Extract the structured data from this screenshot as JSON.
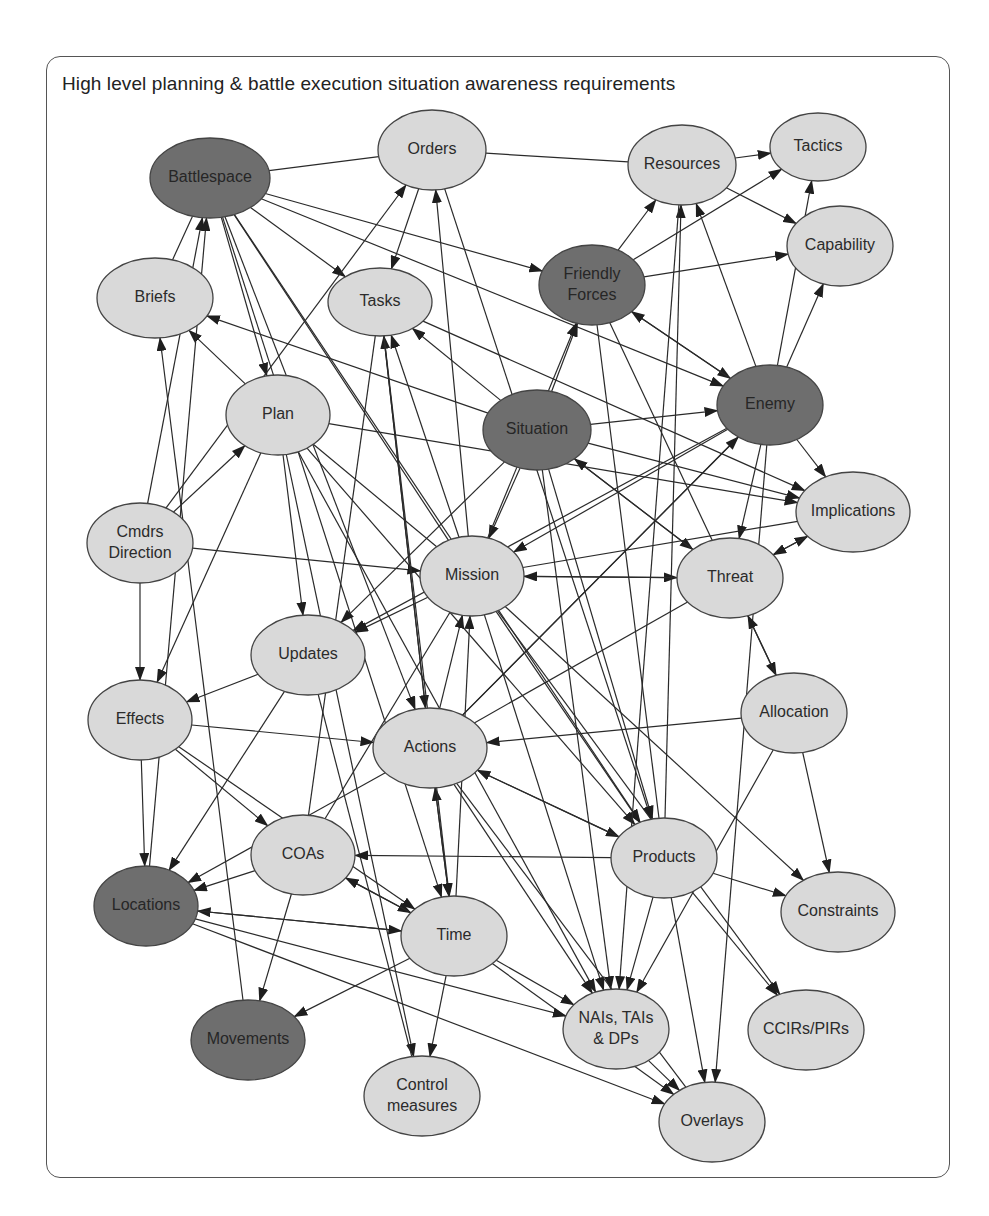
{
  "title": "High level planning & battle execution situation awareness requirements",
  "colors": {
    "light_node": "#d9d9d9",
    "dark_node": "#6e6e6e",
    "edge": "#2a2a2a",
    "border": "#555555"
  },
  "nodes": [
    {
      "id": "battlespace",
      "label": [
        "Battlespace"
      ],
      "x": 210,
      "y": 178,
      "rx": 60,
      "ry": 40,
      "dark": true
    },
    {
      "id": "orders",
      "label": [
        "Orders"
      ],
      "x": 432,
      "y": 150,
      "rx": 54,
      "ry": 40,
      "dark": false
    },
    {
      "id": "resources",
      "label": [
        "Resources"
      ],
      "x": 682,
      "y": 165,
      "rx": 54,
      "ry": 40,
      "dark": false
    },
    {
      "id": "tactics",
      "label": [
        "Tactics"
      ],
      "x": 818,
      "y": 147,
      "rx": 48,
      "ry": 34,
      "dark": false
    },
    {
      "id": "capability",
      "label": [
        "Capability"
      ],
      "x": 840,
      "y": 246,
      "rx": 53,
      "ry": 40,
      "dark": false
    },
    {
      "id": "briefs",
      "label": [
        "Briefs"
      ],
      "x": 155,
      "y": 298,
      "rx": 58,
      "ry": 40,
      "dark": false
    },
    {
      "id": "tasks",
      "label": [
        "Tasks"
      ],
      "x": 380,
      "y": 302,
      "rx": 52,
      "ry": 34,
      "dark": false
    },
    {
      "id": "friendly-forces",
      "label": [
        "Friendly",
        "Forces"
      ],
      "x": 592,
      "y": 285,
      "rx": 53,
      "ry": 40,
      "dark": true
    },
    {
      "id": "plan",
      "label": [
        "Plan"
      ],
      "x": 278,
      "y": 415,
      "rx": 52,
      "ry": 40,
      "dark": false
    },
    {
      "id": "situation",
      "label": [
        "Situation"
      ],
      "x": 537,
      "y": 430,
      "rx": 54,
      "ry": 40,
      "dark": true
    },
    {
      "id": "enemy",
      "label": [
        "Enemy"
      ],
      "x": 770,
      "y": 405,
      "rx": 53,
      "ry": 40,
      "dark": true
    },
    {
      "id": "cmdrs-direction",
      "label": [
        "Cmdrs",
        "Direction"
      ],
      "x": 140,
      "y": 543,
      "rx": 53,
      "ry": 40,
      "dark": false
    },
    {
      "id": "implications",
      "label": [
        "Implications"
      ],
      "x": 853,
      "y": 512,
      "rx": 57,
      "ry": 40,
      "dark": false
    },
    {
      "id": "mission",
      "label": [
        "Mission"
      ],
      "x": 472,
      "y": 576,
      "rx": 52,
      "ry": 40,
      "dark": false
    },
    {
      "id": "threat",
      "label": [
        "Threat"
      ],
      "x": 730,
      "y": 578,
      "rx": 53,
      "ry": 40,
      "dark": false
    },
    {
      "id": "updates",
      "label": [
        "Updates"
      ],
      "x": 308,
      "y": 655,
      "rx": 57,
      "ry": 40,
      "dark": false
    },
    {
      "id": "effects",
      "label": [
        "Effects"
      ],
      "x": 140,
      "y": 720,
      "rx": 52,
      "ry": 40,
      "dark": false
    },
    {
      "id": "allocation",
      "label": [
        "Allocation"
      ],
      "x": 794,
      "y": 713,
      "rx": 53,
      "ry": 40,
      "dark": false
    },
    {
      "id": "actions",
      "label": [
        "Actions"
      ],
      "x": 430,
      "y": 748,
      "rx": 57,
      "ry": 40,
      "dark": false
    },
    {
      "id": "coas",
      "label": [
        "COAs"
      ],
      "x": 303,
      "y": 855,
      "rx": 52,
      "ry": 40,
      "dark": false
    },
    {
      "id": "products",
      "label": [
        "Products"
      ],
      "x": 664,
      "y": 858,
      "rx": 53,
      "ry": 40,
      "dark": false
    },
    {
      "id": "locations",
      "label": [
        "Locations"
      ],
      "x": 146,
      "y": 906,
      "rx": 52,
      "ry": 40,
      "dark": true
    },
    {
      "id": "constraints",
      "label": [
        "Constraints"
      ],
      "x": 838,
      "y": 912,
      "rx": 57,
      "ry": 40,
      "dark": false
    },
    {
      "id": "time",
      "label": [
        "Time"
      ],
      "x": 454,
      "y": 936,
      "rx": 53,
      "ry": 40,
      "dark": false
    },
    {
      "id": "nais",
      "label": [
        "NAIs, TAIs",
        "& DPs"
      ],
      "x": 616,
      "y": 1029,
      "rx": 53,
      "ry": 40,
      "dark": false
    },
    {
      "id": "ccirs",
      "label": [
        "CCIRs/PIRs"
      ],
      "x": 806,
      "y": 1030,
      "rx": 58,
      "ry": 40,
      "dark": false
    },
    {
      "id": "movements",
      "label": [
        "Movements"
      ],
      "x": 248,
      "y": 1040,
      "rx": 57,
      "ry": 40,
      "dark": true
    },
    {
      "id": "control-measures",
      "label": [
        "Control",
        "measures"
      ],
      "x": 422,
      "y": 1096,
      "rx": 58,
      "ry": 40,
      "dark": false
    },
    {
      "id": "overlays",
      "label": [
        "Overlays"
      ],
      "x": 712,
      "y": 1122,
      "rx": 53,
      "ry": 40,
      "dark": false
    }
  ],
  "edges": [
    {
      "from": "battlespace",
      "to": "orders",
      "arrow": false
    },
    {
      "from": "battlespace",
      "to": "tasks",
      "arrow": true
    },
    {
      "from": "battlespace",
      "to": "friendly-forces",
      "arrow": true
    },
    {
      "from": "battlespace",
      "to": "enemy",
      "arrow": true
    },
    {
      "from": "battlespace",
      "to": "plan",
      "arrow": true
    },
    {
      "from": "battlespace",
      "to": "actions",
      "arrow": true
    },
    {
      "from": "battlespace",
      "to": "mission",
      "arrow": false
    },
    {
      "from": "battlespace",
      "to": "products",
      "arrow": true
    },
    {
      "from": "battlespace",
      "to": "time",
      "arrow": true
    },
    {
      "from": "orders",
      "to": "resources",
      "arrow": false
    },
    {
      "from": "orders",
      "to": "tasks",
      "arrow": true
    },
    {
      "from": "orders",
      "to": "products",
      "arrow": true
    },
    {
      "from": "resources",
      "to": "tactics",
      "arrow": true
    },
    {
      "from": "resources",
      "to": "capability",
      "arrow": true
    },
    {
      "from": "friendly-forces",
      "to": "resources",
      "arrow": true
    },
    {
      "from": "friendly-forces",
      "to": "tactics",
      "arrow": true
    },
    {
      "from": "friendly-forces",
      "to": "capability",
      "arrow": true
    },
    {
      "from": "friendly-forces",
      "to": "enemy",
      "arrow": true
    },
    {
      "from": "friendly-forces",
      "to": "threat",
      "arrow": false
    },
    {
      "from": "friendly-forces",
      "to": "products",
      "arrow": false
    },
    {
      "from": "enemy",
      "to": "capability",
      "arrow": true
    },
    {
      "from": "enemy",
      "to": "tactics",
      "arrow": true
    },
    {
      "from": "enemy",
      "to": "resources",
      "arrow": true
    },
    {
      "from": "enemy",
      "to": "friendly-forces",
      "arrow": true
    },
    {
      "from": "enemy",
      "to": "implications",
      "arrow": true
    },
    {
      "from": "enemy",
      "to": "threat",
      "arrow": true
    },
    {
      "from": "enemy",
      "to": "mission",
      "arrow": true
    },
    {
      "from": "enemy",
      "to": "updates",
      "arrow": true
    },
    {
      "from": "enemy",
      "to": "overlays",
      "arrow": true
    },
    {
      "from": "enemy",
      "to": "actions",
      "arrow": false
    },
    {
      "from": "situation",
      "to": "friendly-forces",
      "arrow": true
    },
    {
      "from": "situation",
      "to": "enemy",
      "arrow": true
    },
    {
      "from": "situation",
      "to": "tasks",
      "arrow": true
    },
    {
      "from": "situation",
      "to": "briefs",
      "arrow": true
    },
    {
      "from": "situation",
      "to": "mission",
      "arrow": true
    },
    {
      "from": "situation",
      "to": "implications",
      "arrow": true
    },
    {
      "from": "situation",
      "to": "threat",
      "arrow": true
    },
    {
      "from": "situation",
      "to": "products",
      "arrow": true
    },
    {
      "from": "situation",
      "to": "nais",
      "arrow": true
    },
    {
      "from": "situation",
      "to": "updates",
      "arrow": true
    },
    {
      "from": "plan",
      "to": "briefs",
      "arrow": true
    },
    {
      "from": "plan",
      "to": "implications",
      "arrow": true
    },
    {
      "from": "plan",
      "to": "updates",
      "arrow": true
    },
    {
      "from": "plan",
      "to": "effects",
      "arrow": true
    },
    {
      "from": "plan",
      "to": "products",
      "arrow": true
    },
    {
      "from": "plan",
      "to": "control-measures",
      "arrow": true
    },
    {
      "from": "plan",
      "to": "mission",
      "arrow": false
    },
    {
      "from": "plan",
      "to": "nais",
      "arrow": true
    },
    {
      "from": "cmdrs-direction",
      "to": "plan",
      "arrow": true
    },
    {
      "from": "cmdrs-direction",
      "to": "orders",
      "arrow": true
    },
    {
      "from": "cmdrs-direction",
      "to": "mission",
      "arrow": true
    },
    {
      "from": "cmdrs-direction",
      "to": "effects",
      "arrow": true
    },
    {
      "from": "cmdrs-direction",
      "to": "battlespace",
      "arrow": true
    },
    {
      "from": "mission",
      "to": "tasks",
      "arrow": true
    },
    {
      "from": "mission",
      "to": "orders",
      "arrow": true
    },
    {
      "from": "mission",
      "to": "friendly-forces",
      "arrow": true
    },
    {
      "from": "mission",
      "to": "updates",
      "arrow": true
    },
    {
      "from": "mission",
      "to": "implications",
      "arrow": false
    },
    {
      "from": "mission",
      "to": "threat",
      "arrow": true
    },
    {
      "from": "mission",
      "to": "products",
      "arrow": true
    },
    {
      "from": "mission",
      "to": "constraints",
      "arrow": true
    },
    {
      "from": "mission",
      "to": "nais",
      "arrow": true
    },
    {
      "from": "mission",
      "to": "coas",
      "arrow": false
    },
    {
      "from": "threat",
      "to": "mission",
      "arrow": true
    },
    {
      "from": "threat",
      "to": "implications",
      "arrow": true
    },
    {
      "from": "threat",
      "to": "allocation",
      "arrow": true
    },
    {
      "from": "threat",
      "to": "actions",
      "arrow": false
    },
    {
      "from": "threat",
      "to": "situation",
      "arrow": true
    },
    {
      "from": "implications",
      "to": "threat",
      "arrow": true
    },
    {
      "from": "updates",
      "to": "effects",
      "arrow": true
    },
    {
      "from": "updates",
      "to": "locations",
      "arrow": true
    },
    {
      "from": "updates",
      "to": "control-measures",
      "arrow": false
    },
    {
      "from": "effects",
      "to": "actions",
      "arrow": true
    },
    {
      "from": "effects",
      "to": "coas",
      "arrow": true
    },
    {
      "from": "effects",
      "to": "locations",
      "arrow": true
    },
    {
      "from": "effects",
      "to": "time",
      "arrow": true
    },
    {
      "from": "allocation",
      "to": "actions",
      "arrow": true
    },
    {
      "from": "allocation",
      "to": "threat",
      "arrow": true
    },
    {
      "from": "allocation",
      "to": "constraints",
      "arrow": true
    },
    {
      "from": "allocation",
      "to": "nais",
      "arrow": true
    },
    {
      "from": "actions",
      "to": "tasks",
      "arrow": true
    },
    {
      "from": "actions",
      "to": "mission",
      "arrow": true
    },
    {
      "from": "actions",
      "to": "time",
      "arrow": true
    },
    {
      "from": "actions",
      "to": "locations",
      "arrow": true
    },
    {
      "from": "actions",
      "to": "products",
      "arrow": true
    },
    {
      "from": "actions",
      "to": "nais",
      "arrow": true
    },
    {
      "from": "actions",
      "to": "enemy",
      "arrow": true
    },
    {
      "from": "actions",
      "to": "overlays",
      "arrow": false
    },
    {
      "from": "coas",
      "to": "locations",
      "arrow": true
    },
    {
      "from": "coas",
      "to": "time",
      "arrow": true
    },
    {
      "from": "coas",
      "to": "movements",
      "arrow": true
    },
    {
      "from": "coas",
      "to": "tasks",
      "arrow": false
    },
    {
      "from": "products",
      "to": "coas",
      "arrow": true
    },
    {
      "from": "products",
      "to": "actions",
      "arrow": true
    },
    {
      "from": "products",
      "to": "constraints",
      "arrow": true
    },
    {
      "from": "products",
      "to": "ccirs",
      "arrow": true
    },
    {
      "from": "products",
      "to": "overlays",
      "arrow": true
    },
    {
      "from": "products",
      "to": "nais",
      "arrow": true
    },
    {
      "from": "products",
      "to": "resources",
      "arrow": true
    },
    {
      "from": "time",
      "to": "coas",
      "arrow": true
    },
    {
      "from": "time",
      "to": "locations",
      "arrow": true
    },
    {
      "from": "time",
      "to": "actions",
      "arrow": true
    },
    {
      "from": "time",
      "to": "mission",
      "arrow": true
    },
    {
      "from": "time",
      "to": "control-measures",
      "arrow": true
    },
    {
      "from": "time",
      "to": "nais",
      "arrow": true
    },
    {
      "from": "time",
      "to": "overlays",
      "arrow": true
    },
    {
      "from": "time",
      "to": "movements",
      "arrow": true
    },
    {
      "from": "locations",
      "to": "time",
      "arrow": true
    },
    {
      "from": "locations",
      "to": "nais",
      "arrow": true
    },
    {
      "from": "locations",
      "to": "overlays",
      "arrow": true
    },
    {
      "from": "nais",
      "to": "overlays",
      "arrow": true
    },
    {
      "from": "movements",
      "to": "briefs",
      "arrow": true
    },
    {
      "from": "tasks",
      "to": "implications",
      "arrow": true
    },
    {
      "from": "tasks",
      "to": "actions",
      "arrow": true
    },
    {
      "from": "tasks",
      "to": "time",
      "arrow": true
    },
    {
      "from": "battlespace",
      "to": "briefs",
      "arrow": false
    },
    {
      "from": "locations",
      "to": "battlespace",
      "arrow": true
    },
    {
      "from": "mission",
      "to": "ccirs",
      "arrow": true
    },
    {
      "from": "resources",
      "to": "nais",
      "arrow": true
    }
  ]
}
